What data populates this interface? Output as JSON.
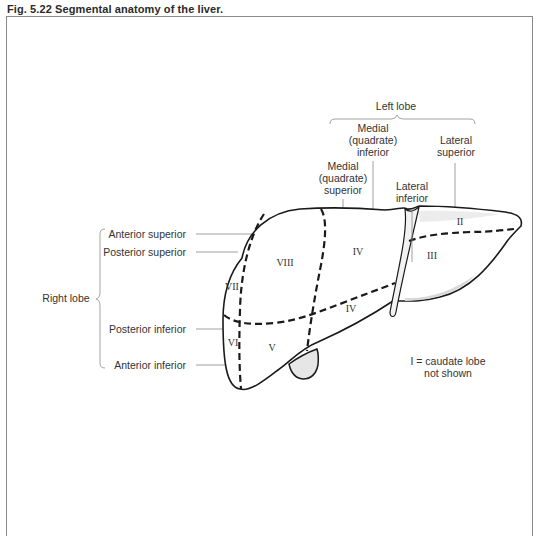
{
  "figure": {
    "title": "Fig. 5.22  Segmental anatomy of the liver."
  },
  "left_lobe": {
    "label": "Left lobe",
    "segments": [
      {
        "name": "medial-quadrate-inferior",
        "lines": [
          "Medial",
          "(quadrate)",
          "inferior"
        ]
      },
      {
        "name": "lateral-superior",
        "lines": [
          "Lateral",
          "superior"
        ]
      },
      {
        "name": "medial-quadrate-superior",
        "lines": [
          "Medial",
          "(quadrate)",
          "superior"
        ]
      },
      {
        "name": "lateral-inferior",
        "lines": [
          "Lateral",
          "inferior"
        ]
      }
    ]
  },
  "right_lobe": {
    "label": "Right lobe",
    "segments": [
      {
        "name": "anterior-superior",
        "label": "Anterior superior"
      },
      {
        "name": "posterior-superior",
        "label": "Posterior superior"
      },
      {
        "name": "posterior-inferior",
        "label": "Posterior inferior"
      },
      {
        "name": "anterior-inferior",
        "label": "Anterior inferior"
      }
    ]
  },
  "segment_numerals": {
    "ii": "II",
    "iii": "III",
    "iv_superior": "IV",
    "iv_inferior": "IV",
    "v": "V",
    "vi": "VI",
    "vii": "VII",
    "viii": "VIII"
  },
  "note": {
    "line1": "I = caudate lobe",
    "line2": "not shown"
  }
}
